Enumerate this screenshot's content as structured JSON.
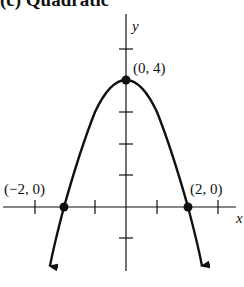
{
  "title": "(c) Quadratic",
  "axes": {
    "x_label": "x",
    "y_label": "y"
  },
  "points": [
    {
      "label": "(0, 4)",
      "x": 0,
      "y": 4
    },
    {
      "label": "(−2, 0)",
      "x": -2,
      "y": 0
    },
    {
      "label": "(2, 0)",
      "x": 2,
      "y": 0
    }
  ],
  "curve": {
    "equation": "y = 4 - x^2",
    "type": "parabola opening downward"
  },
  "colors": {
    "stroke": "#111111",
    "background": "#ffffff"
  }
}
